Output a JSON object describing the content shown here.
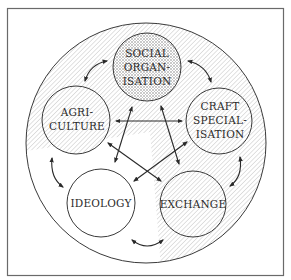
{
  "diagram": {
    "type": "interaction-diagram",
    "nodes": [
      {
        "id": "social",
        "lines": [
          "SOCIAL",
          "ORGAN-",
          "ISATION"
        ],
        "fill": "crosshatch"
      },
      {
        "id": "agriculture",
        "lines": [
          "AGRI-",
          "CULTURE"
        ],
        "fill": "hatch"
      },
      {
        "id": "craft",
        "lines": [
          "CRAFT",
          "SPECIAL-",
          "ISATION"
        ],
        "fill": "hatch"
      },
      {
        "id": "ideology",
        "lines": [
          "IDEOLOGY"
        ],
        "fill": "white"
      },
      {
        "id": "exchange",
        "lines": [
          "EXCHANGE"
        ],
        "fill": "hatch"
      }
    ],
    "links": [
      {
        "from": "agriculture",
        "to": "social",
        "kind": "curved",
        "direction": "both"
      },
      {
        "from": "social",
        "to": "craft",
        "kind": "curved",
        "direction": "both"
      },
      {
        "from": "agriculture",
        "to": "ideology",
        "kind": "curved",
        "direction": "both"
      },
      {
        "from": "craft",
        "to": "exchange",
        "kind": "curved",
        "direction": "both"
      },
      {
        "from": "ideology",
        "to": "exchange",
        "kind": "curved",
        "direction": "both"
      },
      {
        "from": "agriculture",
        "to": "craft",
        "kind": "straight",
        "direction": "both"
      },
      {
        "from": "social",
        "to": "ideology",
        "kind": "straight",
        "direction": "both"
      },
      {
        "from": "social",
        "to": "exchange",
        "kind": "straight",
        "direction": "both"
      },
      {
        "from": "agriculture",
        "to": "exchange",
        "kind": "straight",
        "direction": "both"
      },
      {
        "from": "craft",
        "to": "ideology",
        "kind": "straight",
        "direction": "both"
      }
    ],
    "colors": {
      "line": "#3a3a3a",
      "hatch": "#c4c4c4",
      "frame": "#6a6a6a",
      "background": "#ffffff"
    }
  }
}
